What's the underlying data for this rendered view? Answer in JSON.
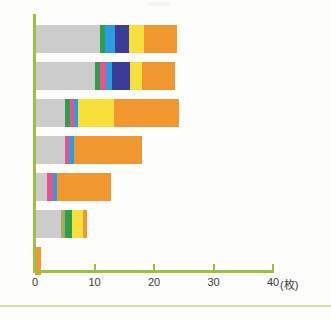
{
  "chart_data": {
    "type": "bar",
    "orientation": "horizontal",
    "stacked": true,
    "title": "",
    "xlabel": "(枚)",
    "ylabel": "",
    "xlim": [
      0,
      40
    ],
    "xticks": [
      0,
      10,
      20,
      30,
      40
    ],
    "xtick_labels": [
      "0",
      "10",
      "20",
      "30",
      "40"
    ],
    "unit_label": "(枚)",
    "grid": false,
    "legend": "none",
    "categories": [
      "1",
      "2",
      "3",
      "4",
      "5",
      "6",
      "7"
    ],
    "series": [
      {
        "name": "gray",
        "color": "#cccccc",
        "values": [
          11.0,
          10.0,
          5.0,
          5.0,
          2.0,
          4.3,
          0.0
        ]
      },
      {
        "name": "olive",
        "color": "#a8a860",
        "values": [
          0.0,
          0.0,
          0.0,
          0.0,
          0.0,
          0.8,
          0.0
        ]
      },
      {
        "name": "green",
        "color": "#2f9e4a",
        "values": [
          0.7,
          1.0,
          0.8,
          0.0,
          0.0,
          1.2,
          0.0
        ]
      },
      {
        "name": "pink",
        "color": "#e8528f",
        "values": [
          0.0,
          1.0,
          0.7,
          0.7,
          1.0,
          0.0,
          0.0
        ]
      },
      {
        "name": "blue",
        "color": "#2b9de0",
        "values": [
          1.8,
          1.0,
          0.7,
          0.8,
          0.7,
          0.0,
          0.0
        ]
      },
      {
        "name": "navy",
        "color": "#3b3b99",
        "values": [
          2.3,
          3.0,
          0.0,
          0.0,
          0.0,
          0.0,
          0.0
        ]
      },
      {
        "name": "yellow",
        "color": "#f8e03c",
        "values": [
          2.5,
          2.0,
          6.0,
          0.0,
          0.0,
          1.7,
          0.0
        ]
      },
      {
        "name": "orange",
        "color": "#f0972f",
        "values": [
          5.5,
          5.5,
          11.0,
          11.5,
          9.0,
          0.7,
          1.0
        ]
      }
    ],
    "totals": [
      23.8,
      23.5,
      24.2,
      18.0,
      12.7,
      8.7,
      1.0
    ],
    "bar_totals_readable": [
      28,
      28,
      25,
      18,
      13,
      9,
      1
    ],
    "axis_color": "#9cc03f",
    "background_color": "#fdfdfb"
  },
  "axis": {
    "ticks": [
      {
        "label": "0",
        "value": 0
      },
      {
        "label": "10",
        "value": 10
      },
      {
        "label": "20",
        "value": 20
      },
      {
        "label": "30",
        "value": 30
      },
      {
        "label": "40",
        "value": 40
      }
    ],
    "unit": "(枚)"
  }
}
